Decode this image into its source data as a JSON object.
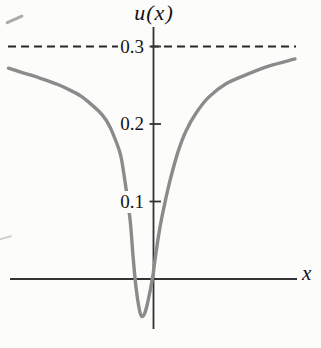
{
  "figure": {
    "background_color": "#fcfcfb",
    "axis_color": "#333333",
    "dash_color": "#262626",
    "curve_color": "#8b8b8b",
    "text_color": "#111111"
  },
  "chart_data": {
    "type": "line",
    "title": "u(x)",
    "xlabel": "x",
    "ylabel": "u(x)",
    "x_ticks": [],
    "x_axis_labeled": false,
    "y_ticks": [
      {
        "value": 0.1,
        "label": "0.1"
      },
      {
        "value": 0.2,
        "label": "0.2"
      },
      {
        "value": 0.3,
        "label": "0.3"
      }
    ],
    "asymptote": {
      "value": 0.3,
      "style": "dashed"
    },
    "ylim": [
      -0.09,
      0.35
    ],
    "grid": false,
    "legend": false,
    "series": [
      {
        "name": "u(x)",
        "color": "#8b8b8b",
        "points": [
          [
            -1.0,
            0.272
          ],
          [
            -0.9,
            0.266
          ],
          [
            -0.78,
            0.259
          ],
          [
            -0.66,
            0.251
          ],
          [
            -0.58,
            0.244
          ],
          [
            -0.5,
            0.236
          ],
          [
            -0.44,
            0.227
          ],
          [
            -0.38,
            0.217
          ],
          [
            -0.33,
            0.206
          ],
          [
            -0.3,
            0.196
          ],
          [
            -0.27,
            0.183
          ],
          [
            -0.24,
            0.168
          ],
          [
            -0.22,
            0.154
          ],
          [
            -0.19,
            0.117
          ],
          [
            -0.16,
            0.074
          ],
          [
            -0.14,
            0.027
          ],
          [
            -0.12,
            -0.012
          ],
          [
            -0.1,
            -0.037
          ],
          [
            -0.083,
            -0.048
          ],
          [
            -0.062,
            -0.045
          ],
          [
            -0.041,
            -0.031
          ],
          [
            -0.021,
            -0.013
          ],
          [
            -0.003,
            0.006
          ],
          [
            0.017,
            0.034
          ],
          [
            0.045,
            0.067
          ],
          [
            0.079,
            0.099
          ],
          [
            0.121,
            0.132
          ],
          [
            0.169,
            0.164
          ],
          [
            0.224,
            0.191
          ],
          [
            0.293,
            0.214
          ],
          [
            0.383,
            0.235
          ],
          [
            0.5,
            0.252
          ],
          [
            0.645,
            0.264
          ],
          [
            0.8,
            0.275
          ],
          [
            0.976,
            0.284
          ]
        ]
      }
    ]
  }
}
